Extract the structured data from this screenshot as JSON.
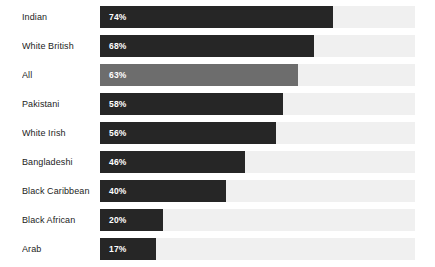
{
  "chart_data": {
    "type": "bar",
    "orientation": "horizontal",
    "title": "",
    "subtitle": "",
    "xlabel": "",
    "ylabel": "",
    "xlim": [
      0,
      100
    ],
    "grid": false,
    "legend": false,
    "value_suffix": "%",
    "categories": [
      "Indian",
      "White British",
      "All",
      "Pakistani",
      "White Irish",
      "Bangladeshi",
      "Black Caribbean",
      "Black African",
      "Arab"
    ],
    "values": [
      74,
      68,
      63,
      58,
      56,
      46,
      40,
      20,
      17
    ],
    "value_labels": [
      "74%",
      "68%",
      "63%",
      "58%",
      "56%",
      "46%",
      "40%",
      "20%",
      "17%"
    ],
    "highlight_index": 2,
    "colors": {
      "bar": "#262626",
      "bar_highlight": "#6d6d6d",
      "track": "#f0f0f0",
      "background": "#ffffff",
      "label_text": "#1c1c1c",
      "value_text": "#ffffff"
    }
  }
}
